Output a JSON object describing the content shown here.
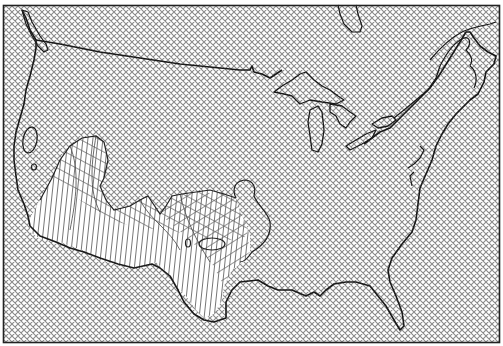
{
  "figure": {
    "type": "map",
    "region": "contiguous-united-states",
    "frame_color": "#222222",
    "hatch_color": "#7a7a7a",
    "outline_color": "#1a1a1a",
    "mesh_color": "#555555",
    "background": "#ffffff",
    "hatch_spacing_px": 6,
    "layers": [
      {
        "name": "background-crosshatch",
        "pattern": "diagonal-crosshatch"
      },
      {
        "name": "country-outline",
        "pattern": "solid-line"
      },
      {
        "name": "great-lakes",
        "pattern": "solid-line"
      },
      {
        "name": "distorted-mesh-region",
        "pattern": "warped-grid",
        "area": "southwest"
      }
    ]
  }
}
